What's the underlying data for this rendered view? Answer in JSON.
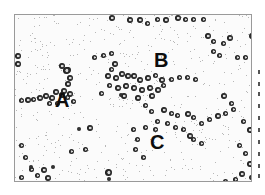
{
  "image": {
    "description": "Micrograph of cells scattered on a stippled background with three labeled clusters",
    "frame_border_color": "#9a9a9a",
    "background_color": "#fbfbfb",
    "cell_color": "#111111"
  },
  "labels": [
    {
      "text": "A",
      "x": 40,
      "y": 75,
      "size": 20
    },
    {
      "text": "B",
      "x": 139,
      "y": 35,
      "size": 20
    },
    {
      "text": "C",
      "x": 135,
      "y": 117,
      "size": 20
    }
  ],
  "cells": [
    [
      0,
      38,
      6
    ],
    [
      0,
      46,
      6
    ],
    [
      44,
      48,
      6
    ],
    [
      50,
      52,
      6
    ],
    [
      48,
      52,
      7
    ],
    [
      52,
      60,
      6
    ],
    [
      50,
      66,
      6
    ],
    [
      46,
      73,
      6
    ],
    [
      52,
      76,
      6
    ],
    [
      4,
      83,
      5
    ],
    [
      10,
      82,
      6
    ],
    [
      16,
      82,
      5
    ],
    [
      22,
      80,
      6
    ],
    [
      28,
      78,
      6
    ],
    [
      34,
      80,
      6
    ],
    [
      38,
      74,
      6
    ],
    [
      44,
      77,
      6
    ],
    [
      50,
      80,
      5
    ],
    [
      56,
      84,
      5
    ],
    [
      32,
      86,
      5
    ],
    [
      40,
      86,
      5
    ],
    [
      77,
      40,
      5
    ],
    [
      86,
      38,
      5
    ],
    [
      94,
      36,
      5
    ],
    [
      97,
      46,
      6
    ],
    [
      94,
      52,
      5
    ],
    [
      90,
      58,
      6
    ],
    [
      98,
      60,
      6
    ],
    [
      104,
      56,
      6
    ],
    [
      110,
      58,
      6
    ],
    [
      116,
      58,
      6
    ],
    [
      122,
      62,
      6
    ],
    [
      130,
      60,
      6
    ],
    [
      138,
      58,
      5
    ],
    [
      144,
      62,
      6
    ],
    [
      92,
      68,
      5
    ],
    [
      100,
      70,
      6
    ],
    [
      108,
      68,
      6
    ],
    [
      116,
      70,
      6
    ],
    [
      124,
      72,
      6
    ],
    [
      132,
      70,
      6
    ],
    [
      140,
      72,
      6
    ],
    [
      146,
      68,
      5
    ],
    [
      84,
      76,
      5
    ],
    [
      106,
      78,
      6
    ],
    [
      120,
      80,
      6
    ],
    [
      134,
      78,
      6
    ],
    [
      154,
      62,
      5
    ],
    [
      162,
      60,
      5
    ],
    [
      170,
      60,
      5
    ],
    [
      178,
      62,
      5
    ],
    [
      94,
      0,
      6
    ],
    [
      112,
      2,
      6
    ],
    [
      122,
      2,
      6
    ],
    [
      130,
      6,
      5
    ],
    [
      140,
      2,
      5
    ],
    [
      148,
      2,
      6
    ],
    [
      160,
      0,
      6
    ],
    [
      168,
      2,
      5
    ],
    [
      176,
      2,
      5
    ],
    [
      186,
      2,
      5
    ],
    [
      190,
      18,
      6
    ],
    [
      196,
      24,
      5
    ],
    [
      196,
      34,
      5
    ],
    [
      202,
      38,
      5
    ],
    [
      206,
      26,
      5
    ],
    [
      212,
      20,
      6
    ],
    [
      234,
      18,
      6
    ],
    [
      220,
      40,
      5
    ],
    [
      228,
      40,
      5
    ],
    [
      240,
      30,
      5
    ],
    [
      104,
      78,
      4
    ],
    [
      128,
      88,
      5
    ],
    [
      134,
      94,
      5
    ],
    [
      146,
      92,
      6
    ],
    [
      154,
      96,
      5
    ],
    [
      160,
      98,
      5
    ],
    [
      170,
      96,
      6
    ],
    [
      176,
      100,
      5
    ],
    [
      140,
      104,
      5
    ],
    [
      150,
      106,
      5
    ],
    [
      116,
      112,
      5
    ],
    [
      128,
      110,
      5
    ],
    [
      138,
      112,
      5
    ],
    [
      158,
      110,
      5
    ],
    [
      166,
      112,
      5
    ],
    [
      172,
      118,
      6
    ],
    [
      176,
      122,
      5
    ],
    [
      184,
      126,
      5
    ],
    [
      120,
      122,
      5
    ],
    [
      118,
      132,
      5
    ],
    [
      126,
      140,
      5
    ],
    [
      184,
      106,
      5
    ],
    [
      192,
      102,
      5
    ],
    [
      200,
      98,
      6
    ],
    [
      208,
      96,
      5
    ],
    [
      216,
      92,
      5
    ],
    [
      206,
      78,
      6
    ],
    [
      214,
      86,
      5
    ],
    [
      226,
      104,
      5
    ],
    [
      232,
      112,
      6
    ],
    [
      222,
      128,
      5
    ],
    [
      228,
      136,
      5
    ],
    [
      232,
      146,
      6
    ],
    [
      224,
      156,
      6
    ],
    [
      218,
      162,
      5
    ],
    [
      208,
      164,
      5
    ],
    [
      196,
      172,
      5
    ],
    [
      234,
      160,
      5
    ],
    [
      62,
      112,
      4
    ],
    [
      72,
      110,
      6
    ],
    [
      54,
      134,
      5
    ],
    [
      68,
      132,
      5
    ],
    [
      36,
      150,
      4
    ],
    [
      14,
      152,
      5
    ],
    [
      90,
      154,
      7
    ],
    [
      92,
      162,
      4
    ],
    [
      98,
      172,
      5
    ],
    [
      4,
      128,
      5
    ],
    [
      8,
      140,
      5
    ],
    [
      14,
      150,
      4
    ],
    [
      20,
      158,
      5
    ],
    [
      26,
      152,
      6
    ],
    [
      30,
      160,
      6
    ],
    [
      34,
      168,
      5
    ],
    [
      22,
      168,
      5
    ],
    [
      8,
      166,
      5
    ],
    [
      4,
      160,
      5
    ]
  ],
  "side_marks": [
    0,
    12,
    22,
    34,
    46,
    58,
    70,
    82,
    94,
    104
  ]
}
